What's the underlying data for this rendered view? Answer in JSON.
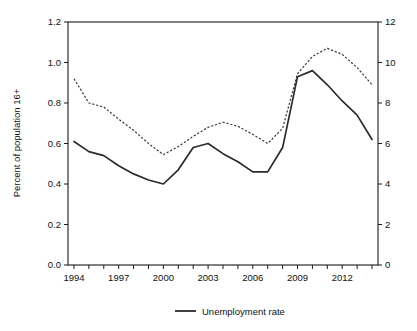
{
  "chart_data": {
    "type": "line",
    "title": "",
    "subtitle": "",
    "xlabel": "",
    "ylabel": "Percent of population 16+",
    "ylabel_right": "",
    "x": [
      1994,
      1995,
      1996,
      1997,
      1998,
      1999,
      2000,
      2001,
      2002,
      2003,
      2004,
      2005,
      2006,
      2007,
      2008,
      2009,
      2010,
      2011,
      2012,
      2013,
      2014
    ],
    "xlim": [
      1993.6,
      2014.4
    ],
    "ylim": [
      0.0,
      1.2
    ],
    "ylim_right": [
      0,
      12
    ],
    "grid": false,
    "legend_position": "bottom-center",
    "x_tick_values": [
      1994,
      1995,
      1996,
      1997,
      1998,
      1999,
      2000,
      2001,
      2002,
      2003,
      2004,
      2005,
      2006,
      2007,
      2008,
      2009,
      2010,
      2011,
      2012,
      2013,
      2014
    ],
    "x_tick_labels": [
      "1994",
      "",
      "",
      "1997",
      "",
      "",
      "2000",
      "",
      "",
      "2003",
      "",
      "",
      "2006",
      "",
      "",
      "2009",
      "",
      "",
      "2012",
      "",
      ""
    ],
    "y_tick_labels_left": [
      "0.0",
      "0.2",
      "0.4",
      "0.6",
      "0.8",
      "1.0",
      "1.2"
    ],
    "y_tick_values_left": [
      0.0,
      0.2,
      0.4,
      0.6,
      0.8,
      1.0,
      1.2
    ],
    "y_tick_labels_right": [
      "0",
      "2",
      "4",
      "6",
      "8",
      "10",
      "12"
    ],
    "y_tick_values_right": [
      0,
      2,
      4,
      6,
      8,
      10,
      12
    ],
    "series": [
      {
        "name": "Unemployment rate",
        "style": "solid",
        "axis": "right",
        "color": "#2b2b2b",
        "values": [
          6.1,
          5.6,
          5.4,
          4.9,
          4.5,
          4.2,
          4.0,
          4.7,
          5.8,
          6.0,
          5.5,
          5.1,
          4.6,
          4.6,
          5.8,
          9.3,
          9.6,
          8.9,
          8.1,
          7.4,
          6.2
        ]
      },
      {
        "name": "",
        "style": "dotted",
        "axis": "left",
        "color": "#3a3a3a",
        "values": [
          0.92,
          0.8,
          0.78,
          0.72,
          0.665,
          0.6,
          0.545,
          0.585,
          0.635,
          0.68,
          0.705,
          0.685,
          0.645,
          0.6,
          0.675,
          0.945,
          1.03,
          1.07,
          1.04,
          0.975,
          0.89
        ]
      }
    ]
  },
  "legend": {
    "entries": [
      {
        "label": "Unemployment rate",
        "style": "solid"
      }
    ]
  }
}
